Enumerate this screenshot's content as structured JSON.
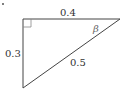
{
  "diagram": {
    "type": "right-triangle",
    "labels": {
      "top_side": "0.4",
      "left_side": "0.3",
      "hypotenuse": "0.5",
      "angle": "β"
    },
    "colors": {
      "stroke": "#444444",
      "right_angle_marker": "#888888"
    }
  }
}
